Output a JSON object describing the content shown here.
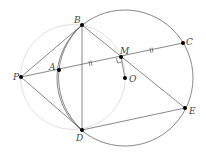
{
  "diagram": {
    "points": {
      "B": {
        "label": "B",
        "x": 82,
        "y": 25
      },
      "P": {
        "label": "P",
        "x": 21,
        "y": 77
      },
      "A": {
        "label": "A",
        "x": 59,
        "y": 70
      },
      "M": {
        "label": "M",
        "x": 121,
        "y": 57
      },
      "C": {
        "label": "C",
        "x": 183,
        "y": 43
      },
      "O": {
        "label": "O",
        "x": 125,
        "y": 78
      },
      "D": {
        "label": "D",
        "x": 82,
        "y": 130
      },
      "E": {
        "label": "E",
        "x": 185,
        "y": 108
      }
    },
    "colors": {
      "main": "#555555",
      "light": "#dddddd",
      "point": "#000000"
    }
  }
}
